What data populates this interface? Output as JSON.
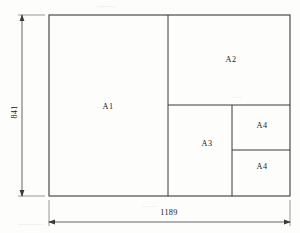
{
  "diagram": {
    "background_color": "#fdfdfc",
    "line_color": "#3a3a3a",
    "sheet": {
      "name": "A0 sheet outline",
      "width_mm": 1189,
      "height_mm": 841
    },
    "areas": [
      {
        "id": "A1",
        "label": "A1"
      },
      {
        "id": "A2",
        "label": "A2"
      },
      {
        "id": "A3",
        "label": "A3"
      },
      {
        "id": "A4-top",
        "label": "A4"
      },
      {
        "id": "A4-bottom",
        "label": "A4"
      }
    ],
    "dimensions": {
      "height": {
        "label": "841",
        "orientation": "vertical",
        "position": "left"
      },
      "width": {
        "label": "1189",
        "orientation": "horizontal",
        "position": "bottom"
      }
    }
  }
}
